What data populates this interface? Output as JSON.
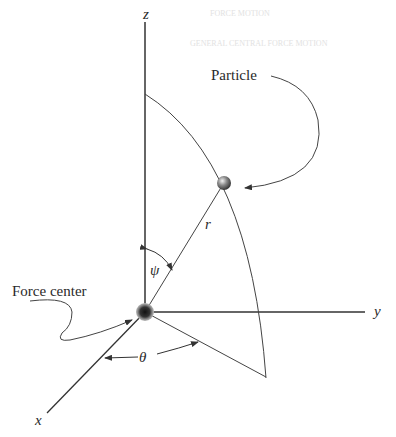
{
  "figure": {
    "labels": {
      "z_axis": "z",
      "y_axis": "y",
      "x_axis": "x",
      "particle": "Particle",
      "force_center": "Force center",
      "radius": "r",
      "polar_angle": "ψ",
      "azimuthal_angle": "θ"
    },
    "bleed_through_text": [
      "FORCE MOTION",
      "GENERAL CENTRAL FORCE MOTION"
    ],
    "colors": {
      "line": "#3a3a3a",
      "text": "#2a2a2a",
      "sphere": "#555555"
    }
  }
}
